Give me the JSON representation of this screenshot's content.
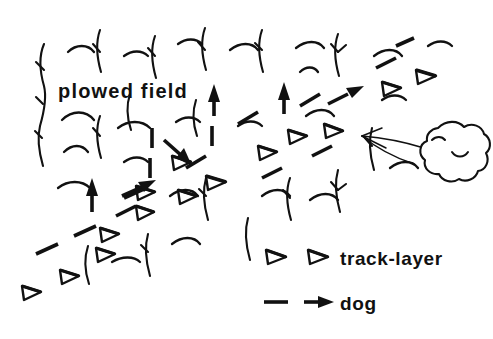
{
  "figure": {
    "type": "hand-drawn-diagram",
    "title_label": "plowed field",
    "background_color": "#ffffff",
    "ink_color": "#111111",
    "width": 493,
    "height": 339
  },
  "annotations": {
    "field_label": {
      "text": "plowed field",
      "x": 58,
      "y": 98
    }
  },
  "legend": {
    "entries": [
      {
        "id": "track-layer",
        "label": "track-layer",
        "symbol": "two-hollow-triangles",
        "symbol_description": "two small hollow right-pointing triangles",
        "label_x": 340,
        "label_y": 265
      },
      {
        "id": "dog",
        "label": "dog",
        "symbol": "dash-then-filled-arrow",
        "symbol_description": "short dash followed by a solid right-pointing arrow",
        "label_x": 340,
        "label_y": 310
      }
    ]
  },
  "scene": {
    "wind": {
      "source": "bush",
      "description": "long thin arrow from bush pointing left",
      "direction": "left"
    },
    "bush": {
      "description": "scalloped cloud-like bush at right edge",
      "cx": 458,
      "cy": 152
    },
    "track_layer_trail": {
      "symbol": "hollow-triangle",
      "description": "trail of hollow triangles running from upper right down toward lower left",
      "count": 14
    },
    "dog_trail": {
      "symbol": "dash-and-arrow",
      "description": "dashed trail with solid arrowheads zig-zagging up through the field",
      "count": 16
    },
    "vegetation": {
      "stalk_count": 16,
      "arc_count": 22,
      "description": "plowed field rows drawn as vertical stalks and short arcs"
    }
  }
}
